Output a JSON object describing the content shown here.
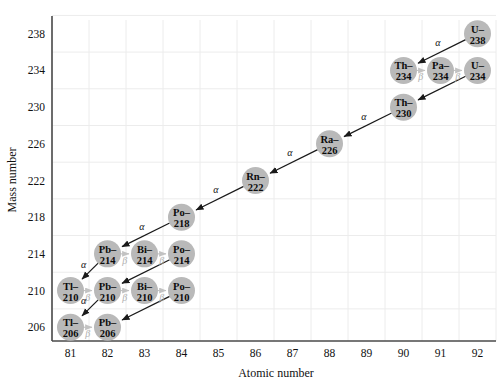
{
  "chart_data": {
    "type": "scatter",
    "title": "",
    "xlabel": "Atomic number",
    "ylabel": "Mass number",
    "xlim": [
      80.5,
      92.5
    ],
    "ylim": [
      204.5,
      239.5
    ],
    "xticks": [
      81,
      82,
      83,
      84,
      85,
      86,
      87,
      88,
      89,
      90,
      91,
      92
    ],
    "yticks": [
      206,
      210,
      214,
      218,
      222,
      226,
      230,
      234,
      238
    ],
    "grid": true,
    "legend": "none",
    "node_color": "#b9b9b9",
    "alpha_color": "#1a1a1a",
    "beta_color": "#c2c2c2",
    "nodes": [
      {
        "id": "U-238",
        "element": "U",
        "line1": "U–",
        "line2": "238",
        "z": 92,
        "a": 238
      },
      {
        "id": "Th-234",
        "element": "Th",
        "line1": "Th–",
        "line2": "234",
        "z": 90,
        "a": 234
      },
      {
        "id": "Pa-234",
        "element": "Pa",
        "line1": "Pa–",
        "line2": "234",
        "z": 91,
        "a": 234
      },
      {
        "id": "U-234",
        "element": "U",
        "line1": "U–",
        "line2": "234",
        "z": 92,
        "a": 234
      },
      {
        "id": "Th-230",
        "element": "Th",
        "line1": "Th–",
        "line2": "230",
        "z": 90,
        "a": 230
      },
      {
        "id": "Ra-226",
        "element": "Ra",
        "line1": "Ra–",
        "line2": "226",
        "z": 88,
        "a": 226
      },
      {
        "id": "Rn-222",
        "element": "Rn",
        "line1": "Rn–",
        "line2": "222",
        "z": 86,
        "a": 222
      },
      {
        "id": "Po-218",
        "element": "Po",
        "line1": "Po–",
        "line2": "218",
        "z": 84,
        "a": 218
      },
      {
        "id": "Pb-214",
        "element": "Pb",
        "line1": "Pb–",
        "line2": "214",
        "z": 82,
        "a": 214
      },
      {
        "id": "Bi-214",
        "element": "Bi",
        "line1": "Bi–",
        "line2": "214",
        "z": 83,
        "a": 214
      },
      {
        "id": "Po-214",
        "element": "Po",
        "line1": "Po–",
        "line2": "214",
        "z": 84,
        "a": 214
      },
      {
        "id": "Tl-210",
        "element": "Tl",
        "line1": "Tl–",
        "line2": "210",
        "z": 81,
        "a": 210
      },
      {
        "id": "Pb-210",
        "element": "Pb",
        "line1": "Pb–",
        "line2": "210",
        "z": 82,
        "a": 210
      },
      {
        "id": "Bi-210",
        "element": "Bi",
        "line1": "Bi–",
        "line2": "210",
        "z": 83,
        "a": 210
      },
      {
        "id": "Po-210",
        "element": "Po",
        "line1": "Po–",
        "line2": "210",
        "z": 84,
        "a": 210
      },
      {
        "id": "Tl-206",
        "element": "Tl",
        "line1": "Tl–",
        "line2": "206",
        "z": 81,
        "a": 206
      },
      {
        "id": "Pb-206",
        "element": "Pb",
        "line1": "Pb–",
        "line2": "206",
        "z": 82,
        "a": 206
      }
    ],
    "decays": [
      {
        "from": "U-238",
        "to": "Th-234",
        "type": "alpha",
        "label": "α"
      },
      {
        "from": "Th-234",
        "to": "Pa-234",
        "type": "beta",
        "label": "β"
      },
      {
        "from": "Pa-234",
        "to": "U-234",
        "type": "beta",
        "label": "β"
      },
      {
        "from": "U-234",
        "to": "Th-230",
        "type": "alpha",
        "label": "α"
      },
      {
        "from": "Th-230",
        "to": "Ra-226",
        "type": "alpha",
        "label": "α"
      },
      {
        "from": "Ra-226",
        "to": "Rn-222",
        "type": "alpha",
        "label": "α"
      },
      {
        "from": "Rn-222",
        "to": "Po-218",
        "type": "alpha",
        "label": "α"
      },
      {
        "from": "Po-218",
        "to": "Pb-214",
        "type": "alpha",
        "label": "α"
      },
      {
        "from": "Pb-214",
        "to": "Bi-214",
        "type": "beta",
        "label": "β"
      },
      {
        "from": "Bi-214",
        "to": "Po-214",
        "type": "beta",
        "label": "β"
      },
      {
        "from": "Pb-214",
        "to": "Tl-210",
        "type": "alpha",
        "label": "α"
      },
      {
        "from": "Po-214",
        "to": "Pb-210",
        "type": "alpha",
        "label": "α"
      },
      {
        "from": "Tl-210",
        "to": "Pb-210",
        "type": "beta",
        "label": "β"
      },
      {
        "from": "Pb-210",
        "to": "Bi-210",
        "type": "beta",
        "label": "β"
      },
      {
        "from": "Bi-210",
        "to": "Po-210",
        "type": "beta",
        "label": "β"
      },
      {
        "from": "Pb-210",
        "to": "Tl-206",
        "type": "alpha",
        "label": "α"
      },
      {
        "from": "Po-210",
        "to": "Pb-206",
        "type": "alpha",
        "label": "α"
      },
      {
        "from": "Tl-206",
        "to": "Pb-206",
        "type": "beta",
        "label": "β"
      }
    ]
  }
}
